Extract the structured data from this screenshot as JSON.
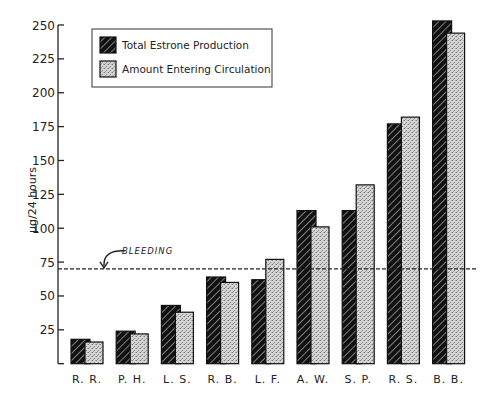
{
  "chart_data": {
    "type": "bar",
    "title": "",
    "xlabel": "",
    "ylabel": "μg/24 hours",
    "ylim": [
      0,
      250
    ],
    "yticks": [
      25,
      50,
      75,
      100,
      125,
      150,
      175,
      200,
      225,
      250
    ],
    "grid": false,
    "legend_position": "upper-left",
    "categories": [
      "R. R.",
      "P. H.",
      "L. S.",
      "R. B.",
      "L. F.",
      "A. W.",
      "S. P.",
      "R. S.",
      "B. B."
    ],
    "series": [
      {
        "name": "Total Estrone Production",
        "pattern": "hatched-dark",
        "values": [
          18,
          24,
          43,
          64,
          62,
          113,
          113,
          177,
          253
        ]
      },
      {
        "name": "Amount Entering Circulation",
        "pattern": "stippled-light",
        "values": [
          16,
          22,
          38,
          60,
          77,
          101,
          132,
          182,
          244
        ]
      }
    ],
    "annotations": [
      {
        "type": "hline",
        "y": 70,
        "style": "dashed",
        "label": "BLEEDING"
      }
    ]
  },
  "colors": {
    "dark_bar": "#1c1c1c",
    "light_bar": "#c8c8c8",
    "axis": "#222222"
  }
}
